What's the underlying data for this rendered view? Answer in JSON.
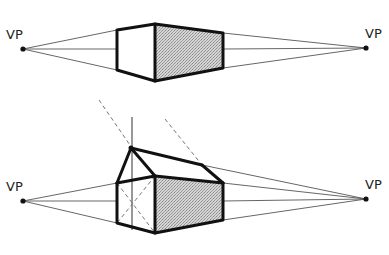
{
  "diagram": {
    "colors": {
      "line": "#111111",
      "guide": "#555555",
      "shade": "#c8c8c8",
      "background": "#ffffff"
    },
    "top_figure": {
      "label_left": "VP",
      "label_right": "VP",
      "vp_left": [
        23,
        49
      ],
      "vp_right": [
        366,
        48
      ],
      "subject": "box"
    },
    "bottom_figure": {
      "label_left": "VP",
      "label_right": "VP",
      "vp_left": [
        23,
        201
      ],
      "vp_right": [
        366,
        199
      ],
      "subject": "house with gable roof"
    }
  }
}
